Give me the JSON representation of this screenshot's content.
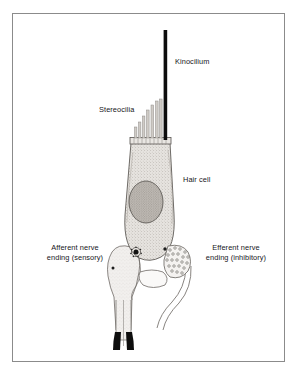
{
  "figure": {
    "frame_color": "#8b8b8b",
    "background_color": "#ffffff",
    "ink_color": "#15161a"
  },
  "labels": {
    "kinocilium": "Kinocilium",
    "stereocilia": "Stereocilia",
    "hair_cell": "Hair cell",
    "afferent_line1": "Afferent nerve",
    "afferent_line2": "ending (sensory)",
    "efferent_line1": "Efferent nerve",
    "efferent_line2": "ending (inhibitory)"
  },
  "structures": {
    "kinocilium": {
      "name": "kinocilium",
      "description": "single thick black rod rising from the apex of the hair cell",
      "color": "#0d0d0d"
    },
    "stereocilia": {
      "name": "stereocilia",
      "description": "graduated staircase bundle of thin pale rods beside the kinocilium",
      "count": 7,
      "color": "#b9b9b9"
    },
    "cuticular_plate": {
      "name": "cuticular-plate",
      "description": "narrow horizontal banded plate at the cell apex"
    },
    "hair_cell_body": {
      "name": "hair-cell-body",
      "description": "flask shaped stippled cell body",
      "fill": "#d8d4cf"
    },
    "nucleus": {
      "name": "nucleus",
      "description": "darker stippled oval nucleus in the lower third of the cell body",
      "fill": "#a8a49f"
    },
    "afferent_ending": {
      "name": "afferent-nerve-ending",
      "description": "chalice shaped pale nerve ending applied to the left base of the hair cell, containing a dark synaptic ribbon with surrounding vesicles"
    },
    "efferent_ending": {
      "name": "efferent-nerve-ending",
      "description": "pouch on the right base of the hair cell filled with small synaptic vesicles, with two fibres trailing below"
    },
    "nerve_fibre": {
      "name": "afferent-nerve-fibre",
      "description": "pale fibre descending from the afferent ending to a black myelin cap split into two prongs",
      "cap_color": "#0d0d0d"
    }
  }
}
